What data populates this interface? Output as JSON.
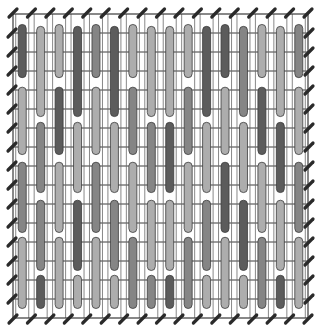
{
  "title": "",
  "diagram": {
    "kind": "stitch-chart",
    "columns": 16,
    "rows": 16,
    "shades": {
      "dark": "#5c5c5c",
      "medium": "#858585",
      "light": "#adadad"
    },
    "grid_color": "#3a3a3a",
    "tick_color": "#2a2a2a",
    "patterns": {
      "A": [
        [
          0.55,
          3.35
        ],
        [
          3.85,
          7.4
        ],
        [
          7.8,
          11.5
        ],
        [
          11.75,
          15.5
        ]
      ],
      "B": [
        [
          0.65,
          5.4
        ],
        [
          5.7,
          9.4
        ],
        [
          9.8,
          13.5
        ],
        [
          13.75,
          15.5
        ]
      ]
    },
    "stitch_columns": [
      {
        "pattern": "A",
        "shades": [
          "dark",
          "light",
          "medium",
          "light"
        ]
      },
      {
        "pattern": "B",
        "shades": [
          "light",
          "medium",
          "medium",
          "dark"
        ]
      },
      {
        "pattern": "A",
        "shades": [
          "light",
          "dark",
          "light",
          "light"
        ]
      },
      {
        "pattern": "B",
        "shades": [
          "dark",
          "light",
          "dark",
          "light"
        ]
      },
      {
        "pattern": "A",
        "shades": [
          "medium",
          "light",
          "medium",
          "light"
        ]
      },
      {
        "pattern": "B",
        "shades": [
          "dark",
          "light",
          "medium",
          "light"
        ]
      },
      {
        "pattern": "A",
        "shades": [
          "light",
          "medium",
          "light",
          "medium"
        ]
      },
      {
        "pattern": "B",
        "shades": [
          "light",
          "medium",
          "light",
          "medium"
        ]
      },
      {
        "pattern": "B",
        "shades": [
          "light",
          "dark",
          "light",
          "dark"
        ]
      },
      {
        "pattern": "A",
        "shades": [
          "light",
          "medium",
          "light",
          "medium"
        ]
      },
      {
        "pattern": "B",
        "shades": [
          "dark",
          "light",
          "medium",
          "light"
        ]
      },
      {
        "pattern": "A",
        "shades": [
          "dark",
          "light",
          "dark",
          "light"
        ]
      },
      {
        "pattern": "B",
        "shades": [
          "medium",
          "light",
          "dark",
          "light"
        ]
      },
      {
        "pattern": "A",
        "shades": [
          "light",
          "dark",
          "light",
          "medium"
        ]
      },
      {
        "pattern": "B",
        "shades": [
          "light",
          "dark",
          "light",
          "dark"
        ]
      },
      {
        "pattern": "A",
        "shades": [
          "medium",
          "light",
          "medium",
          "light"
        ]
      }
    ]
  }
}
